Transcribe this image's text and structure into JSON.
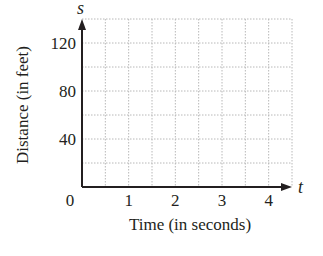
{
  "chart_data": {
    "type": "line",
    "title": "",
    "xlabel": "Time (in seconds)",
    "ylabel": "Distance (in feet)",
    "x_axis_variable": "t",
    "y_axis_variable": "s",
    "x_ticks": [
      "1",
      "2",
      "3",
      "4"
    ],
    "y_ticks": [
      "40",
      "80",
      "120"
    ],
    "origin_label": "0",
    "xlim": [
      0,
      4.5
    ],
    "ylim": [
      0,
      140
    ],
    "grid": true,
    "grid_style": "dotted",
    "x_minor_step": 0.5,
    "y_minor_step": 20,
    "series": [],
    "legend": null
  },
  "colors": {
    "axis": "#231f20",
    "grid": "#b8b8b8",
    "text": "#231f20",
    "background": "#ffffff"
  }
}
